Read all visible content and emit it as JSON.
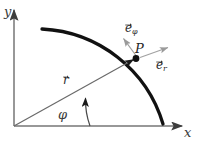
{
  "figure": {
    "background_color": "#ffffff",
    "width": 198,
    "height": 141
  },
  "axes": {
    "x_label": "x",
    "y_label": "y",
    "color": "#6e6e6e",
    "origin": {
      "x": 14,
      "y": 126
    },
    "x_end": {
      "x": 184,
      "y": 126
    },
    "y_end": {
      "x": 14,
      "y": 8
    }
  },
  "arc": {
    "name": "circular-arc",
    "color": "#111111",
    "stroke_width": 3.2,
    "start": {
      "x": 42,
      "y": 29
    },
    "end": {
      "x": 163,
      "y": 124
    },
    "radius": 133
  },
  "point": {
    "label": "P",
    "x": 136,
    "y": 58,
    "marker_color": "#111111"
  },
  "vectors": [
    {
      "name": "position-vector-r",
      "label_base": "r",
      "label_sub": "",
      "color": "#5a5a5a",
      "from": {
        "x": 14,
        "y": 126
      },
      "to": {
        "x": 136,
        "y": 58
      },
      "label_x": 63,
      "label_y": 77
    },
    {
      "name": "unit-vector-e-phi",
      "label_base": "e",
      "label_sub": "φ",
      "color": "#8e8e8e",
      "from": {
        "x": 137,
        "y": 57
      },
      "to": {
        "x": 122,
        "y": 36
      },
      "label_x": 126,
      "label_y": 25
    },
    {
      "name": "unit-vector-e-r",
      "label_base": "e",
      "label_sub": "r",
      "color": "#9a9a9a",
      "from": {
        "x": 139,
        "y": 58
      },
      "to": {
        "x": 170,
        "y": 47
      },
      "label_x": 156,
      "label_y": 62
    }
  ],
  "angle": {
    "label": "φ",
    "label_x": 58,
    "label_y": 110,
    "color": "#4a4a4a",
    "arc_from": {
      "x": 90,
      "y": 126
    },
    "arc_to": {
      "x": 84,
      "y": 95
    }
  }
}
